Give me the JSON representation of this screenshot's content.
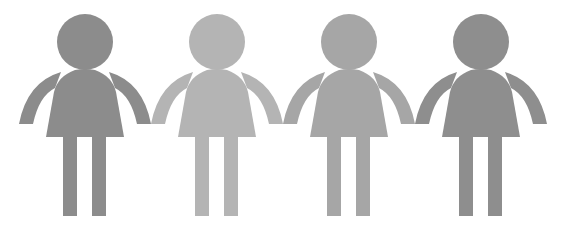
{
  "scene": {
    "description": "Four stylized person icons holding hands in a row",
    "background": "#ffffff",
    "figures": [
      {
        "name": "figure-1",
        "cx": 85,
        "color": "#8c8c8c"
      },
      {
        "name": "figure-2",
        "cx": 217,
        "color": "#b4b4b4"
      },
      {
        "name": "figure-3",
        "cx": 349,
        "color": "#a6a6a6"
      },
      {
        "name": "figure-4",
        "cx": 481,
        "color": "#8e8e8e"
      }
    ]
  }
}
